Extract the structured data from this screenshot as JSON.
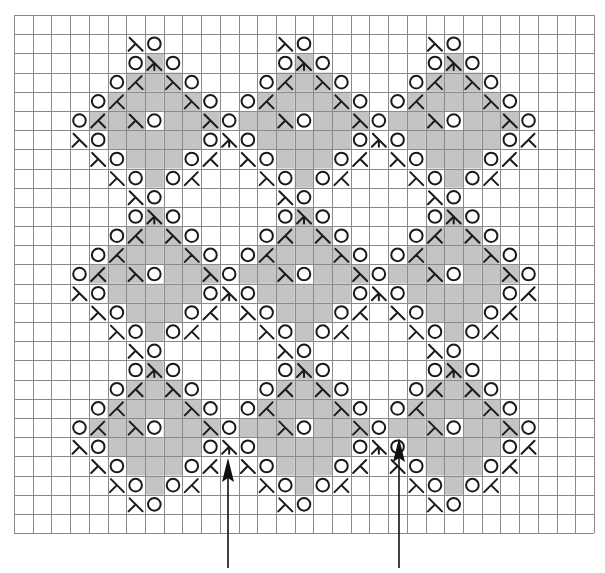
{
  "diagram": {
    "type": "knitting-lace-chart",
    "grid": {
      "columns": 31,
      "rows": 27,
      "origin_x": 14,
      "origin_y": 15,
      "cell_width": 18.71,
      "cell_height": 19.19
    },
    "colors": {
      "background": "#ffffff",
      "grid_line": "#8a8a8a",
      "shaded_cell": "#c4c4c4",
      "symbol": "#1a1a1a",
      "arrow": "#111111"
    },
    "legend_codes": {
      ".": "empty cell",
      "s": "shaded cell (no symbol)",
      "O": "yarn-over circle (white cell)",
      "L": "right-slant decrease glyph (white cell)",
      "l": "right-slant decrease glyph (shaded cell)",
      "K": "left-slant decrease glyph (white cell)",
      "k": "left-slant decrease glyph (shaded cell)",
      "D": "double decrease glyph (white cell)",
      "d": "double decrease glyph (shaded cell)"
    },
    "rows": [
      "...............................",
      "......LO......LO......LO.......",
      "......OdO.....OdO.....OdO......",
      ".....OkslO...OkslO...OkslO.....",
      "....OkssslO.OkssslO.OkssslO....",
      "...OkslOsslOsslOsslOsslOsslO...",
      "...LOsssssODOsssssODOsssssOK...",
      "....LOsssOK.LOsssOK.LOsssOK....",
      ".....LOsOK...LOsOK...LOsOK.....",
      "......LO......LO......LO.......",
      "......OdO.....OdO.....OdO......",
      ".....OkslO...OkslO...OkslO.....",
      "....OkssslO.OkssslO.OkssslO....",
      "...OkslOsslOsslOsslOsslOsslO...",
      "...LOsssssODOsssssODOsssssOK...",
      "....LOsssOK.LOsssOK.LOsssOK....",
      ".....LOsOK...LOsOK...LOsOK.....",
      "......LO......LO......LO.......",
      "......OdO.....OdO.....OdO......",
      ".....OkslO...OkslO...OkslO.....",
      "....OkssslO.OkssslO.OkssslO....",
      "...OkslOsslOsslOsslOsslOsslO...",
      "...LOsssssODOsssssODOsssssOK...",
      "....LOsssOK.LOsssOK.LOsssOK....",
      ".....LOsOK...LOsOK...LOsOK.....",
      "......LO......LO......LO.......",
      "..............................."
    ],
    "arrows": [
      {
        "name": "arrow-left",
        "x": 228,
        "y_tip": 458,
        "y_tail": 568
      },
      {
        "name": "arrow-right",
        "x": 399,
        "y_tip": 438,
        "y_tail": 568
      }
    ]
  }
}
